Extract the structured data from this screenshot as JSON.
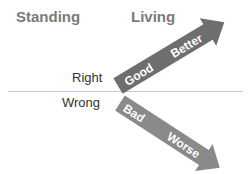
{
  "headers": {
    "left": "Standing",
    "right": "Living"
  },
  "rows": {
    "top": "Right",
    "bottom": "Wrong"
  },
  "arrows": {
    "up": {
      "start_label": "Good",
      "end_label": "Better",
      "color": "#6e6e6e"
    },
    "down": {
      "start_label": "Bad",
      "end_label": "Worse",
      "color": "#8a8a8a"
    }
  },
  "colors": {
    "header": "#7a7a7a",
    "label": "#333333",
    "divider": "#c8c8c8",
    "arrow_text": "#ffffff"
  }
}
